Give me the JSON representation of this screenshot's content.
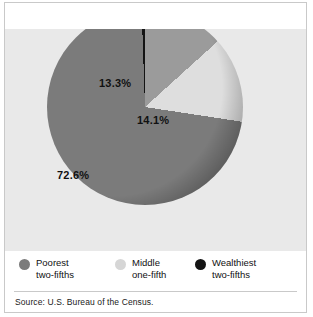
{
  "figure": {
    "background_color": "#ffffff",
    "panel_color": "#e9e9e9",
    "border_color": "#c9c9c9"
  },
  "source": {
    "text": "Source: U.S. Bureau of the Census."
  },
  "legend": {
    "items": [
      {
        "label": "Poorest\ntwo-fifths",
        "color": "#7b7b7b",
        "name": "poorest"
      },
      {
        "label": "Middle\none-fifth",
        "color": "#d6d6d6",
        "name": "middle"
      },
      {
        "label": "Wealthiest\ntwo-fifths",
        "color": "#141414",
        "name": "wealthiest"
      }
    ]
  },
  "labels": {
    "middle_pct": "13.3%",
    "wealthiest_pct": "14.1%",
    "poorest_pct": "72.6%"
  },
  "chart_data": {
    "type": "pie",
    "title": "",
    "subtitle": "",
    "xlabel": "",
    "ylabel": "",
    "legend_position": "bottom",
    "grid": false,
    "start_angle_deg": 0,
    "direction": "clockwise",
    "center_px": [
      146,
      130
    ],
    "radius_px": 96,
    "categories": [
      "Middle one-fifth",
      "Wealthiest two-fifths",
      "Poorest two-fifths"
    ],
    "values": [
      13.3,
      14.1,
      72.6
    ],
    "value_unit": "percent",
    "data_labels": [
      "13.3%",
      "14.1%",
      "72.6%"
    ],
    "colors": [
      "#9b9b9b",
      "#dedede",
      "#7b7b7b"
    ],
    "slice_order_clockwise_from_12": [
      {
        "name": "Middle one-fifth",
        "value": 13.3,
        "label": "13.3%",
        "color": "#9b9b9b"
      },
      {
        "name": "Wealthiest two-fifths",
        "value": 14.1,
        "label": "14.1%",
        "color": "#dedede"
      },
      {
        "name": "Poorest two-fifths",
        "value": 72.6,
        "label": "72.6%",
        "color": "#7b7b7b"
      }
    ],
    "source": "Source: U.S. Bureau of the Census."
  },
  "pie_render": {
    "conic_gradient": "conic-gradient(from 0deg, #9b9b9b 0deg 47.88deg, #dedede 47.88deg 98.64deg, #7b7b7b 98.64deg 358deg, #141414 358deg 360deg)",
    "rim_shadow": "radial-gradient(circle at 34% 40%, rgba(0,0,0,0) 62%, rgba(0,0,0,0.55) 97%, rgba(0,0,0,0.1) 100%)"
  }
}
